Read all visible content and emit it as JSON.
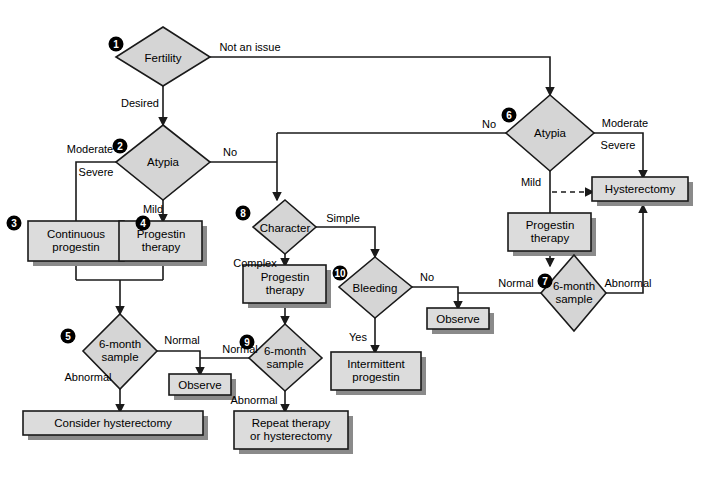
{
  "diagram": {
    "type": "flowchart",
    "background_color": "#ffffff",
    "shape_fill": "#d5d5d5",
    "box_fill": "#dcdcdc",
    "shadow_color": "#8a8a8a",
    "stroke_color": "#1a1a1a",
    "step_badge_color": "#000000"
  },
  "nodes": [
    {
      "id": "n1",
      "step": "1",
      "shape": "diamond",
      "label": "Fertility"
    },
    {
      "id": "n2",
      "step": "2",
      "shape": "diamond",
      "label": "Atypia"
    },
    {
      "id": "n3",
      "step": "3",
      "shape": "box",
      "label": "Continuous\nprogestin"
    },
    {
      "id": "n4",
      "step": "4",
      "shape": "box",
      "label": "Progestin\ntherapy"
    },
    {
      "id": "n5",
      "step": "5",
      "shape": "diamond",
      "label": "6-month\nsample"
    },
    {
      "id": "n6",
      "step": "6",
      "shape": "diamond",
      "label": "Atypia"
    },
    {
      "id": "n7",
      "step": "7",
      "shape": "diamond",
      "label": "6-month\nsample"
    },
    {
      "id": "n8",
      "step": "8",
      "shape": "diamond",
      "label": "Character"
    },
    {
      "id": "n9",
      "step": "9",
      "shape": "diamond",
      "label": "6-month\nsample"
    },
    {
      "id": "n10",
      "step": "10",
      "shape": "diamond",
      "label": "Bleeding"
    },
    {
      "id": "b_hyst",
      "step": "",
      "shape": "box",
      "label": "Hysterectomy"
    },
    {
      "id": "b_prog6",
      "step": "",
      "shape": "box",
      "label": "Progestin\ntherapy"
    },
    {
      "id": "b_prog8",
      "step": "",
      "shape": "box",
      "label": "Progestin\ntherapy"
    },
    {
      "id": "b_obs7",
      "step": "",
      "shape": "box",
      "label": "Observe"
    },
    {
      "id": "b_obs5",
      "step": "",
      "shape": "box",
      "label": "Observe"
    },
    {
      "id": "b_interm",
      "step": "",
      "shape": "box",
      "label": "Intermittent\nprogestin"
    },
    {
      "id": "b_consider",
      "step": "",
      "shape": "box",
      "label": "Consider hysterectomy"
    },
    {
      "id": "b_repeat",
      "step": "",
      "shape": "box",
      "label": "Repeat therapy\nor hysterectomy"
    }
  ],
  "edges": [
    {
      "from": "n1",
      "to": "n6",
      "label": "Not an issue"
    },
    {
      "from": "n1",
      "to": "n2",
      "label": "Desired"
    },
    {
      "from": "n2",
      "to": "n3",
      "label": "Moderate"
    },
    {
      "from": "n2",
      "to": "n3",
      "label": "Severe"
    },
    {
      "from": "n2",
      "to": "n4",
      "label": "Mild"
    },
    {
      "from": "n2",
      "to": "n8",
      "label": "No"
    },
    {
      "from": "n3",
      "to": "n5",
      "label": ""
    },
    {
      "from": "n4",
      "to": "n5",
      "label": ""
    },
    {
      "from": "n5",
      "to": "b_obs5",
      "label": "Normal"
    },
    {
      "from": "n5",
      "to": "b_consider",
      "label": "Abnormal"
    },
    {
      "from": "n6",
      "to": "b_hyst",
      "label": "Moderate"
    },
    {
      "from": "n6",
      "to": "b_hyst",
      "label": "Severe"
    },
    {
      "from": "n6",
      "to": "b_prog6",
      "label": "Mild"
    },
    {
      "from": "n6",
      "to": "b_hyst",
      "label": "",
      "style": "dashed"
    },
    {
      "from": "n6",
      "to": "n8",
      "label": "No"
    },
    {
      "from": "b_prog6",
      "to": "n7",
      "label": ""
    },
    {
      "from": "n7",
      "to": "b_obs7",
      "label": "Normal"
    },
    {
      "from": "n7",
      "to": "b_hyst",
      "label": "Abnormal"
    },
    {
      "from": "n8",
      "to": "n10",
      "label": "Simple"
    },
    {
      "from": "n8",
      "to": "b_prog8",
      "label": "Complex"
    },
    {
      "from": "b_prog8",
      "to": "n9",
      "label": ""
    },
    {
      "from": "n9",
      "to": "b_obs5",
      "label": "Normal"
    },
    {
      "from": "n9",
      "to": "b_repeat",
      "label": "Abnormal"
    },
    {
      "from": "n10",
      "to": "b_obs7",
      "label": "No"
    },
    {
      "from": "n10",
      "to": "b_interm",
      "label": "Yes"
    }
  ],
  "labels": {
    "not_an_issue": "Not an issue",
    "desired": "Desired",
    "moderate_2": "Moderate",
    "severe_2": "Severe",
    "no_2": "No",
    "mild_2": "Mild",
    "normal_5": "Normal",
    "abnormal_5": "Abnormal",
    "no_6": "No",
    "moderate_6": "Moderate",
    "severe_6": "Severe",
    "mild_6": "Mild",
    "normal_7": "Normal",
    "abnormal_7": "Abnormal",
    "simple_8": "Simple",
    "complex_8": "Complex",
    "normal_9": "Normal",
    "abnormal_9": "Abnormal",
    "no_10": "No",
    "yes_10": "Yes"
  },
  "node_labels": {
    "fertility": "Fertility",
    "atypia_2": "Atypia",
    "continuous_progestin": "Continuous\nprogestin",
    "progestin_therapy_4": "Progestin\ntherapy",
    "six_month_sample_5": "6-month\nsample",
    "atypia_6": "Atypia",
    "six_month_sample_7": "6-month\nsample",
    "character_8": "Character",
    "six_month_sample_9": "6-month\nsample",
    "bleeding_10": "Bleeding",
    "hysterectomy": "Hysterectomy",
    "progestin_therapy_6": "Progestin\ntherapy",
    "progestin_therapy_8": "Progestin\ntherapy",
    "observe_7": "Observe",
    "observe_5": "Observe",
    "intermittent_progestin": "Intermittent\nprogestin",
    "consider_hysterectomy": "Consider hysterectomy",
    "repeat_or_hysterectomy": "Repeat therapy\nor hysterectomy"
  },
  "steps": {
    "s1": "1",
    "s2": "2",
    "s3": "3",
    "s4": "4",
    "s5": "5",
    "s6": "6",
    "s7": "7",
    "s8": "8",
    "s9": "9",
    "s10": "10"
  }
}
